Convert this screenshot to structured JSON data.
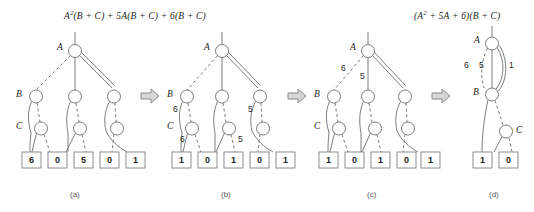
{
  "figure": {
    "titles": [
      {
        "lhs_var": "A",
        "sup": "2",
        "rest": "(B + C) + 5A(B + C) + 6(B + C)"
      },
      {
        "lhs_var": "(A",
        "sup": "2",
        "rest": " + 5A + 6)(B + C)"
      }
    ],
    "title_a_full": "A2(B + C) + 5A(B + C) + 6(B + C)",
    "title_d_full": "(A2 + 5A + 6)(B + C)",
    "arrow_icon": "right-arrow-icon",
    "panels": [
      {
        "id": "a",
        "caption": "(a)",
        "levels": [
          "A",
          "B",
          "C"
        ],
        "terminals": [
          "6",
          "0",
          "5",
          "0",
          "1"
        ],
        "edge_labels": []
      },
      {
        "id": "b",
        "caption": "(b)",
        "levels": [
          "A",
          "B",
          "C"
        ],
        "terminals": [
          "1",
          "0",
          "1",
          "0",
          "1"
        ],
        "edge_labels": [
          "6",
          "5",
          "6",
          "5"
        ]
      },
      {
        "id": "c",
        "caption": "(c)",
        "levels": [
          "A",
          "B",
          "C"
        ],
        "terminals": [
          "1",
          "0",
          "1",
          "0",
          "1"
        ],
        "edge_labels": [
          "6",
          "5"
        ]
      },
      {
        "id": "d",
        "caption": "(d)",
        "levels": [
          "A",
          "B",
          "C"
        ],
        "terminals": [
          "1",
          "0"
        ],
        "edge_labels": [
          "6",
          "5",
          "1"
        ]
      }
    ],
    "colors": {
      "line": "#6d6e71",
      "text": "#231f20",
      "caption": "#58595b",
      "arrow_fill": "#d6d6d6",
      "arrow_stroke": "#8a8a8a",
      "box_stroke": "#808285",
      "background": "#ffffff"
    }
  }
}
